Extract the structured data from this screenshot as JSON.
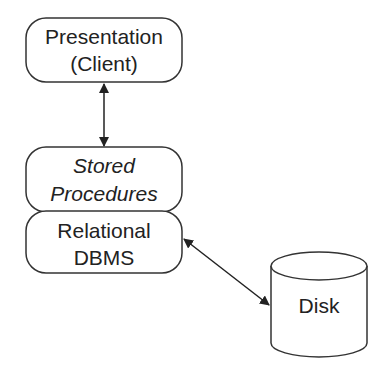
{
  "diagram": {
    "nodes": [
      {
        "id": "presentation",
        "shape": "rounded-rect",
        "lines": [
          "Presentation",
          "(Client)"
        ],
        "italic": false
      },
      {
        "id": "stored-procedures",
        "shape": "rounded-rect",
        "lines": [
          "Stored",
          "Procedures"
        ],
        "italic": true
      },
      {
        "id": "relational-dbms",
        "shape": "rounded-rect",
        "lines": [
          "Relational",
          "DBMS"
        ],
        "italic": false
      },
      {
        "id": "disk",
        "shape": "cylinder",
        "lines": [
          "Disk"
        ],
        "italic": false
      }
    ],
    "edges": [
      {
        "from": "presentation",
        "to": "stored-procedures",
        "direction": "bidirectional"
      },
      {
        "from": "relational-dbms",
        "to": "disk",
        "direction": "bidirectional"
      }
    ],
    "colors": {
      "stroke": "#333333",
      "text": "#222222",
      "background": "#ffffff"
    }
  }
}
